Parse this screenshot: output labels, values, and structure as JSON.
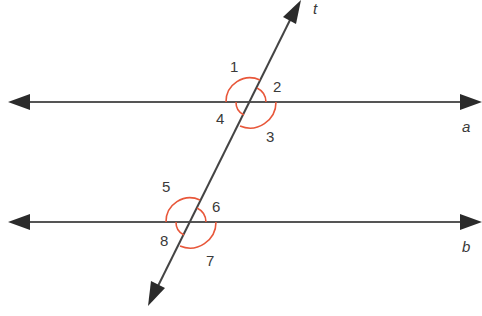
{
  "diagram": {
    "colors": {
      "line": "#333333",
      "arc": "#e8573a",
      "text": "#3a3a3a",
      "background": "#ffffff"
    },
    "lines": {
      "a": {
        "label": "a",
        "y": 102
      },
      "b": {
        "label": "b",
        "y": 222
      },
      "t": {
        "label": "t"
      }
    },
    "angles": {
      "top_intersection": [
        "1",
        "2",
        "3",
        "4"
      ],
      "bottom_intersection": [
        "5",
        "6",
        "7",
        "8"
      ]
    },
    "labels": {
      "a1": "1",
      "a2": "2",
      "a3": "3",
      "a4": "4",
      "a5": "5",
      "a6": "6",
      "a7": "7",
      "a8": "8",
      "line_a": "a",
      "line_b": "b",
      "line_t": "t"
    }
  }
}
